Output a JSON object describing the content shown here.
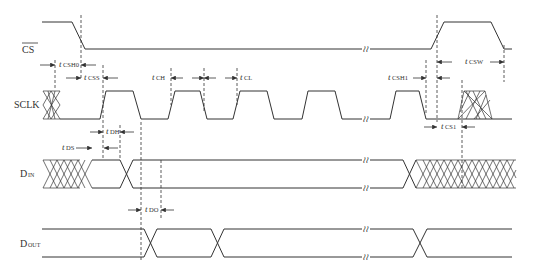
{
  "diagram": {
    "signals": [
      {
        "name": "CS",
        "overline": true
      },
      {
        "name": "SCLK",
        "overline": false
      },
      {
        "name": "D",
        "sub": "IN"
      },
      {
        "name": "D",
        "sub": "OUT"
      }
    ],
    "break_symbol": "≀≀",
    "timing_params": [
      {
        "t": "t",
        "sub": "CSH0"
      },
      {
        "t": "t",
        "sub": "CSS"
      },
      {
        "t": "t",
        "sub": "CH"
      },
      {
        "t": "t",
        "sub": "CL"
      },
      {
        "t": "t",
        "sub": "DS"
      },
      {
        "t": "t",
        "sub": "DH"
      },
      {
        "t": "t",
        "sub": "DO"
      },
      {
        "t": "t",
        "sub": "CSH1"
      },
      {
        "t": "t",
        "sub": "CSW"
      },
      {
        "t": "t",
        "sub": "CS1"
      }
    ]
  }
}
